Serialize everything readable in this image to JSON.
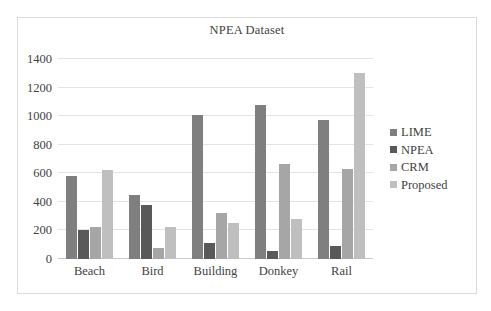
{
  "chart_data": {
    "type": "bar",
    "title": "NPEA Dataset",
    "xlabel": "",
    "ylabel": "",
    "ylim": [
      0,
      1400
    ],
    "yticks": [
      0,
      200,
      400,
      600,
      800,
      1000,
      1200,
      1400
    ],
    "ytick_labels": [
      "0",
      "200",
      "400",
      "600",
      "800",
      "1000",
      "1200",
      "1400"
    ],
    "grid": true,
    "legend_position": "right",
    "categories": [
      "Beach",
      "Bird",
      "Building",
      "Donkey",
      "Rail"
    ],
    "series": [
      {
        "name": "LIME",
        "color": "#7f7f7f",
        "values": [
          580,
          450,
          1010,
          1075,
          975
        ]
      },
      {
        "name": "NPEA",
        "color": "#595959",
        "values": [
          200,
          380,
          110,
          55,
          90
        ]
      },
      {
        "name": "CRM",
        "color": "#a6a6a6",
        "values": [
          225,
          78,
          325,
          665,
          630
        ]
      },
      {
        "name": "Proposed",
        "color": "#bfbfbf",
        "values": [
          625,
          225,
          250,
          280,
          1305
        ]
      }
    ]
  },
  "frame": {
    "border_color": "#dcdcdc",
    "background": "#ffffff",
    "gridline_color": "#e3e3e3"
  }
}
